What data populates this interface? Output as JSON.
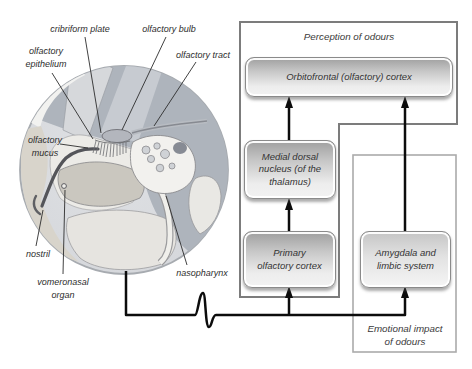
{
  "figure_type": "olfactory-system-diagram",
  "anatomy": {
    "labels": [
      {
        "id": "cribriform-plate",
        "lines": [
          "cribriform plate"
        ]
      },
      {
        "id": "olfactory-bulb",
        "lines": [
          "olfactory bulb"
        ]
      },
      {
        "id": "olfactory-epithelium",
        "lines": [
          "olfactory",
          "epithelium"
        ]
      },
      {
        "id": "olfactory-tract",
        "lines": [
          "olfactory tract"
        ]
      },
      {
        "id": "olfactory-mucus",
        "lines": [
          "olfactory",
          "mucus"
        ]
      },
      {
        "id": "nostril",
        "lines": [
          "nostril"
        ]
      },
      {
        "id": "vomeronasal-organ",
        "lines": [
          "vomeronasal",
          "organ"
        ]
      },
      {
        "id": "nasopharynx",
        "lines": [
          "nasopharynx"
        ]
      }
    ]
  },
  "flowchart": {
    "groups": {
      "perception": {
        "label": "Perception of odours"
      },
      "emotional": {
        "lines": [
          "Emotional impact",
          "of odours"
        ]
      }
    },
    "boxes": [
      {
        "id": "orbitofrontal-cortex",
        "lines": [
          "Orbitofrontal (olfactory) cortex"
        ]
      },
      {
        "id": "medial-dorsal-nucleus",
        "lines": [
          "Medial dorsal",
          "nucleus (of the",
          "thalamus)"
        ]
      },
      {
        "id": "primary-olfactory-cortex",
        "lines": [
          "Primary",
          "olfactory cortex"
        ]
      },
      {
        "id": "amygdala-limbic-system",
        "lines": [
          "Amygdala and",
          "limbic system"
        ]
      }
    ],
    "connections": [
      "signal-line: olfactory bulb -> primary olfactory cortex",
      "signal-line: olfactory bulb -> amygdala and limbic system",
      "primary olfactory cortex -> medial dorsal nucleus",
      "medial dorsal nucleus -> orbitofrontal cortex",
      "amygdala and limbic system -> orbitofrontal cortex"
    ]
  },
  "colors": {
    "background": "#ffffff",
    "line_black": "#0c0c0c",
    "perception_border": "#7c7c7c",
    "emotional_border": "#ababab",
    "box_border": "#8a8a8a",
    "box_gradient_top": "#9f9f9f",
    "box_gradient_bottom": "#f2f2f2",
    "brain_gray": "#aeb4bc",
    "circle_bg": "#d8dade",
    "bone_white": "#f2f1ee",
    "tissue_beige": "#cac7bf",
    "text": "#2d2d2d"
  }
}
